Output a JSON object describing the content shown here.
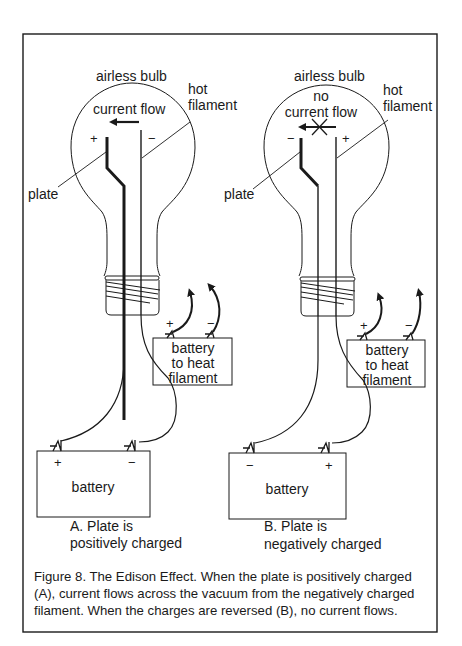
{
  "figure": {
    "panel_a": {
      "bulb_label": "airless bulb",
      "filament_label_line1": "hot",
      "filament_label_line2": "filament",
      "flow_label": "current flow",
      "plate_label": "plate",
      "plate_sign": "+",
      "filament_sign": "−",
      "heater_battery": {
        "line1": "battery",
        "line2": "to heat",
        "line3": "filament",
        "pos_sign": "+",
        "neg_sign": "−"
      },
      "main_battery": {
        "label": "battery",
        "left_sign": "+",
        "right_sign": "−"
      },
      "caption_line1": "A.  Plate is",
      "caption_line2": "positively charged"
    },
    "panel_b": {
      "bulb_label": "airless bulb",
      "filament_label_line1": "hot",
      "filament_label_line2": "filament",
      "flow_label_line1": "no",
      "flow_label_line2": "current flow",
      "plate_label": "plate",
      "plate_sign": "−",
      "filament_sign": "+",
      "heater_battery": {
        "line1": "battery",
        "line2": "to heat",
        "line3": "filament",
        "pos_sign": "+",
        "neg_sign": "−"
      },
      "main_battery": {
        "label": "battery",
        "left_sign": "−",
        "right_sign": "+"
      },
      "caption_line1": "B.  Plate is",
      "caption_line2": "negatively charged"
    },
    "caption": {
      "line1": "Figure 8.  The Edison Effect.  When the plate is positively charged",
      "line2": "(A), current flows across the vacuum from the negatively charged",
      "line3": "filament. When the charges are reversed (B), no current flows."
    }
  },
  "colors": {
    "ink": "#1a1a1a",
    "paper": "#ffffff"
  }
}
